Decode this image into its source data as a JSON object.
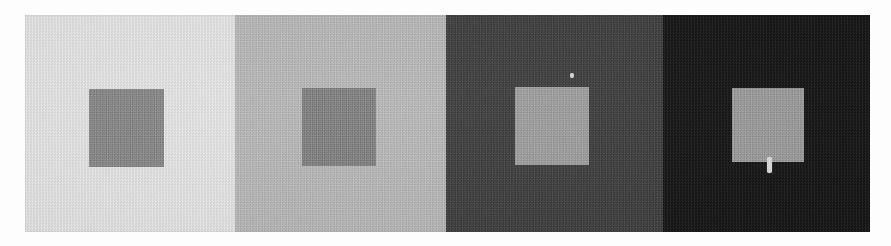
{
  "figure": {
    "panel_count": 4,
    "plate": {
      "x": 25,
      "y": 15,
      "width": 845,
      "height": 217
    },
    "page_background": "#fdfdfd",
    "panels": [
      {
        "index": 1,
        "name": "panel-lightest",
        "background_color": "#e6e6e6",
        "background_level": "very light gray",
        "width": 210,
        "square": {
          "name": "square-1",
          "color": "#868686",
          "level": "medium gray",
          "x": 64,
          "y": 74,
          "width": 75,
          "height": 78
        }
      },
      {
        "index": 2,
        "name": "panel-light",
        "background_color": "#b7b7b7",
        "background_level": "light gray",
        "width": 211,
        "square": {
          "name": "square-2",
          "color": "#7e7e7e",
          "level": "medium gray",
          "x": 67,
          "y": 73,
          "width": 74,
          "height": 78
        }
      },
      {
        "index": 3,
        "name": "panel-dark",
        "background_color": "#3a3a3a",
        "background_level": "dark gray",
        "width": 217,
        "square": {
          "name": "square-3",
          "color": "#9c9c9c",
          "level": "light-medium gray",
          "x": 69,
          "y": 72,
          "width": 74,
          "height": 78
        }
      },
      {
        "index": 4,
        "name": "panel-darkest",
        "background_color": "#101010",
        "background_level": "near black",
        "width": 207,
        "square": {
          "name": "square-4",
          "color": "#9a9a9a",
          "level": "light-medium gray",
          "x": 69,
          "y": 73,
          "width": 72,
          "height": 74
        }
      }
    ],
    "artifacts": [
      {
        "name": "scan-speck-panel-3",
        "panel": 3,
        "x": 124,
        "y": 58,
        "width": 4,
        "height": 5
      },
      {
        "name": "scan-mark-panel-4",
        "panel": 4,
        "x": 104,
        "y": 142,
        "width": 5,
        "height": 16
      }
    ],
    "colors": {
      "accent": "#808080",
      "page": "#fdfdfd"
    }
  }
}
